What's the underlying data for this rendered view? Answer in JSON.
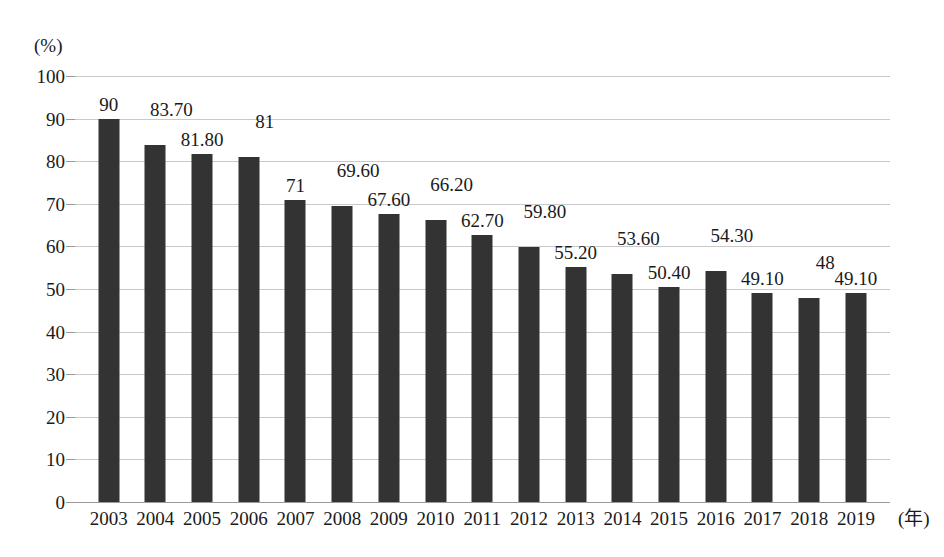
{
  "chart_data": {
    "type": "bar",
    "title": "",
    "xlabel": "(年)",
    "ylabel": "(%)",
    "categories": [
      "2003",
      "2004",
      "2005",
      "2006",
      "2007",
      "2008",
      "2009",
      "2010",
      "2011",
      "2012",
      "2013",
      "2014",
      "2015",
      "2016",
      "2017",
      "2018",
      "2019"
    ],
    "values": [
      90,
      83.7,
      81.8,
      81,
      71,
      69.6,
      67.6,
      66.2,
      62.7,
      59.8,
      55.2,
      53.6,
      50.4,
      54.3,
      49.1,
      48,
      49.1
    ],
    "value_labels": [
      "90",
      "83.70",
      "81.80",
      "81",
      "71",
      "69.60",
      "67.60",
      "66.20",
      "62.70",
      "59.80",
      "55.20",
      "53.60",
      "50.40",
      "54.30",
      "49.10",
      "48",
      "49.10"
    ],
    "ylim": [
      0,
      100
    ],
    "yticks": [
      100,
      90,
      80,
      70,
      60,
      50,
      40,
      30,
      20,
      10,
      0
    ],
    "ytick_labels": [
      "100",
      "90",
      "80",
      "70",
      "60",
      "50",
      "40",
      "30",
      "20",
      "10",
      "0"
    ],
    "grid": true,
    "legend": "none",
    "series_color": "#333333",
    "gridline_color": "#c9c9c9",
    "label_stagger": [
      0,
      1,
      0,
      1,
      0,
      1,
      0,
      1,
      0,
      1,
      0,
      1,
      0,
      1,
      0,
      1,
      0
    ]
  }
}
